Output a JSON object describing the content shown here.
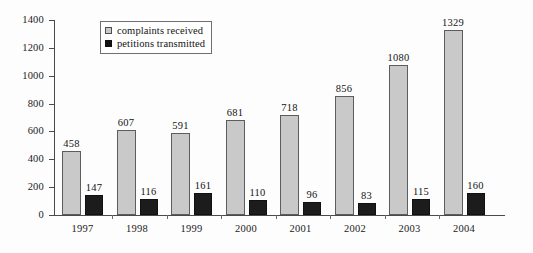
{
  "chart_data": {
    "type": "bar",
    "title": "",
    "xlabel": "",
    "ylabel": "",
    "categories": [
      "1997",
      "1998",
      "1999",
      "2000",
      "2001",
      "2002",
      "2003",
      "2004"
    ],
    "series": [
      {
        "name": "complaints received",
        "color": "#c9c9c9",
        "values": [
          458,
          607,
          591,
          681,
          718,
          856,
          1080,
          1329
        ]
      },
      {
        "name": "petitions transmitted",
        "color": "#1c1c1c",
        "values": [
          147,
          116,
          161,
          110,
          96,
          83,
          115,
          160
        ]
      }
    ],
    "ylim": [
      0,
      1400
    ],
    "y_ticks": [
      0,
      200,
      400,
      600,
      800,
      1000,
      1200,
      1400
    ],
    "y_tick_labels": [
      "0",
      "200",
      "400",
      "600",
      "800",
      "1000",
      "1200",
      "1400"
    ],
    "grid": false,
    "legend_position": "top-left-inside",
    "data_labels": true
  },
  "legend": {
    "items": [
      {
        "label": "complaints received",
        "marker": "light-square-swatch"
      },
      {
        "label": "petitions transmitted",
        "marker": "dark-square-swatch"
      }
    ]
  }
}
